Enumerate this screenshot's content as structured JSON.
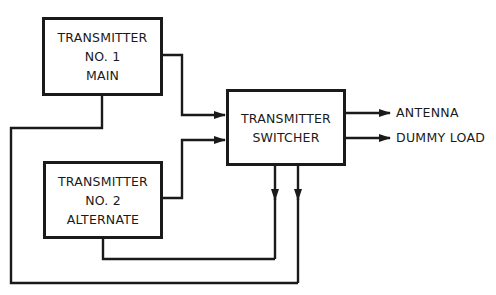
{
  "diagram": {
    "type": "block-diagram",
    "colors": {
      "line": "#1a1a1a",
      "background": "#ffffff"
    },
    "blocks": {
      "tx1": {
        "lines": [
          "TRANSMITTER",
          "NO. 1",
          "MAIN"
        ]
      },
      "tx2": {
        "lines": [
          "TRANSMITTER",
          "NO. 2",
          "ALTERNATE"
        ]
      },
      "switcher": {
        "lines": [
          "TRANSMITTER",
          "SWITCHER"
        ]
      }
    },
    "outputs": {
      "antenna": "ANTENNA",
      "dummy_load": "DUMMY LOAD"
    },
    "connections": [
      {
        "from": "tx1",
        "to": "switcher",
        "label": "RF output"
      },
      {
        "from": "tx2",
        "to": "switcher",
        "label": "RF output"
      },
      {
        "from": "switcher",
        "to": "antenna"
      },
      {
        "from": "switcher",
        "to": "dummy_load"
      },
      {
        "from": "switcher",
        "to": "tx2",
        "label": "control"
      },
      {
        "from": "switcher",
        "to": "tx1",
        "label": "control"
      }
    ]
  }
}
